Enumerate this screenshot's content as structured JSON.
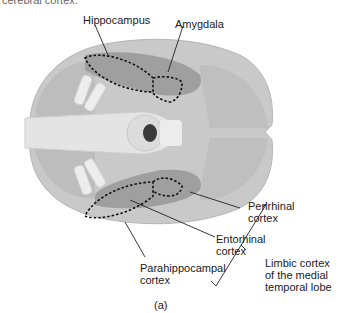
{
  "caption_top": "cerebral cortex.",
  "labels": {
    "hippocampus": "Hippocampus",
    "amygdala": "Amygdala",
    "perirhinal": "Perirhinal\ncortex",
    "entorhinal": "Entorhinal\ncortex",
    "parahippocampal": "Parahippocampal\ncortex",
    "limbic": "Limbic cortex\nof the medial\ntemporal lobe"
  },
  "figure_label": "(a)",
  "colors": {
    "brain_light": "#c8c8c8",
    "brain_mid": "#a9a9a9",
    "brain_dark": "#8a8a8a",
    "brainstem": "#e2e2e2",
    "outline_dashed": "#111111"
  }
}
